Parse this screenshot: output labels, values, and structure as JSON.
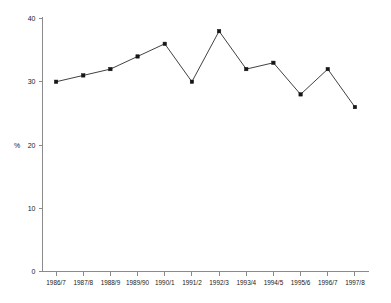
{
  "chart_data": {
    "type": "line",
    "title": "",
    "subtitle": "",
    "xlabel": "",
    "ylabel": "%",
    "categories": [
      "1986/7",
      "1987/8",
      "1988/9",
      "1989/90",
      "1990/1",
      "1991/2",
      "1992/3",
      "1993/4",
      "1994/5",
      "1995/6",
      "1996/7",
      "1997/8"
    ],
    "values": [
      30,
      31,
      32,
      34,
      36,
      30,
      38,
      32,
      33,
      28,
      32,
      26
    ],
    "ylim": [
      0,
      40
    ],
    "ytick_labels": [
      "0",
      "10",
      "20",
      "30",
      "40"
    ],
    "ytick_values": [
      0,
      10,
      20,
      30,
      40
    ],
    "grid": false,
    "legend": null,
    "legend_position": "none",
    "marker": "filled-square",
    "line_color": "#2b2b2b",
    "marker_color": "#151515",
    "axis_color": "#8a8a8a",
    "background_color": "#ffffff"
  }
}
